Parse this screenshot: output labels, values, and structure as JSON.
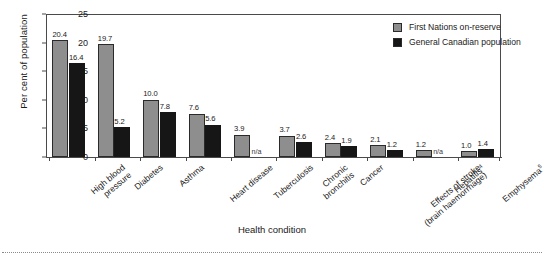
{
  "chart_data": {
    "type": "bar",
    "title": "",
    "xlabel": "Health condition",
    "ylabel": "Per cent of population",
    "ylim": [
      0,
      25
    ],
    "yticks": [
      "0",
      "5",
      "10",
      "15",
      "20",
      "25"
    ],
    "grid": false,
    "legend_position": "top-right-inside",
    "na_label": "n/a",
    "categories": [
      "High blood pressure",
      "Diabetes",
      "Asthma",
      "Heart disease",
      "Tuberculosis",
      "Chronic bronchitis",
      "Cancer",
      "Effects of stroke (brain haemorrhage)",
      "Hepatitis",
      "Emphysema"
    ],
    "category_lines": [
      [
        "High blood",
        "pressure"
      ],
      [
        "Diabetes",
        ""
      ],
      [
        "Asthma",
        ""
      ],
      [
        "Heart disease",
        ""
      ],
      [
        "Tuberculosis",
        ""
      ],
      [
        "Chronic",
        "bronchitis"
      ],
      [
        "Cancer",
        ""
      ],
      [
        "Effects of stroke",
        "(brain haemorrhage)"
      ],
      [
        "Hepatitis",
        ""
      ],
      [
        "Emphysema",
        ""
      ]
    ],
    "category_superscripts": [
      "",
      "",
      "",
      "",
      "",
      "",
      "",
      "",
      "4",
      "5"
    ],
    "series": [
      {
        "name": "First Nations on-reserve",
        "color": "#8e8e8e",
        "values": [
          20.4,
          19.7,
          10.0,
          7.6,
          3.9,
          3.7,
          2.4,
          2.1,
          1.2,
          1.0
        ],
        "labels": [
          "20.4",
          "19.7",
          "10.0",
          "7.6",
          "3.9",
          "3.7",
          "2.4",
          "2.1",
          "1.2",
          "1.0"
        ]
      },
      {
        "name": "General Canadian population",
        "color": "#161616",
        "values": [
          16.4,
          5.2,
          7.8,
          5.6,
          null,
          2.6,
          1.9,
          1.2,
          null,
          1.4
        ],
        "labels": [
          "16.4",
          "5.2",
          "7.8",
          "5.6",
          "n/a",
          "2.6",
          "1.9",
          "1.2",
          "n/a",
          "1.4"
        ]
      }
    ]
  },
  "legend": {
    "items": [
      {
        "label": "First Nations on-reserve"
      },
      {
        "label": "General Canadian population"
      }
    ]
  }
}
